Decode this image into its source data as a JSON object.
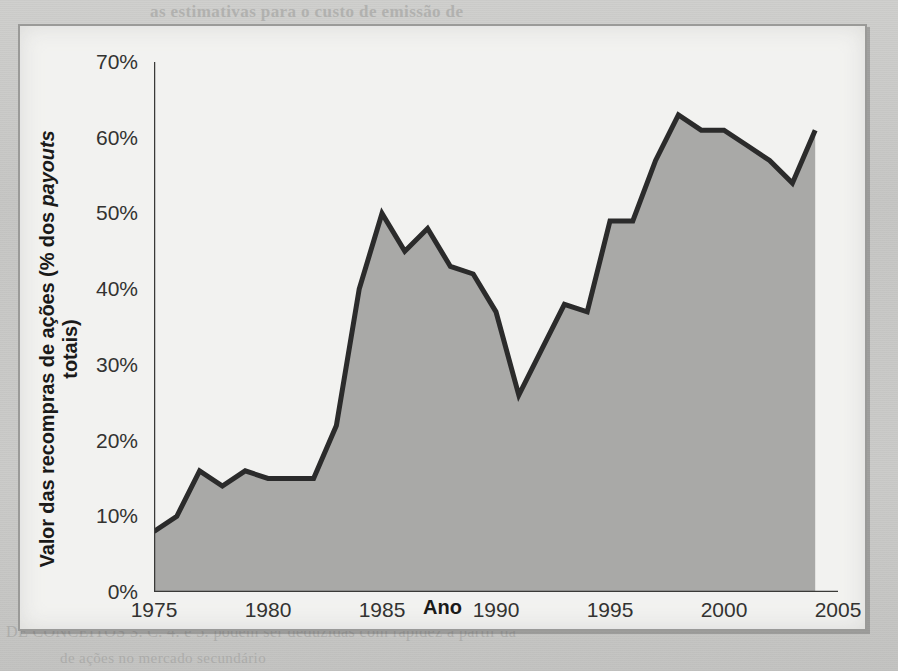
{
  "page": {
    "background_color": "#c9c9c7",
    "panel_color": "#f2f2f0",
    "ghost_text_top": "as estimativas para o custo de emissão de",
    "ghost_text_top2": "em 2004, sugerindo que as empresas estao adotando um",
    "ghost_text_bottom": "DE CONCEITOS    3. C. 4. e  5. podem ser deduzidas com rapidez a partir da",
    "ghost_text_bottom2": "de ações no mercado secundário"
  },
  "figure": {
    "border_color": "#9a9a98"
  },
  "chart_data": {
    "type": "area",
    "title": "",
    "subtitle": "",
    "xlabel": "Ano",
    "ylabel": "Valor das recompras de ações (% dos payouts totais)",
    "ylabel_parts": {
      "pre": "Valor das recompras de ações (% dos ",
      "italic": "payouts",
      "post": " totais)"
    },
    "xlim": [
      1975,
      2005
    ],
    "ylim": [
      0,
      70
    ],
    "grid": false,
    "legend": null,
    "y_tick_labels": [
      "0%",
      "10%",
      "20%",
      "30%",
      "40%",
      "50%",
      "60%",
      "70%"
    ],
    "y_tick_values": [
      0,
      10,
      20,
      30,
      40,
      50,
      60,
      70
    ],
    "x_tick_labels": [
      "1975",
      "1980",
      "1985",
      "1990",
      "1995",
      "2000",
      "2005"
    ],
    "x_tick_values": [
      1975,
      1980,
      1985,
      1990,
      1995,
      2000,
      2005
    ],
    "line_color": "#2b2b2b",
    "fill_color": "#a9a9a7",
    "line_width": 5,
    "x": [
      1975,
      1976,
      1977,
      1978,
      1979,
      1980,
      1981,
      1982,
      1983,
      1984,
      1985,
      1986,
      1987,
      1988,
      1989,
      1990,
      1991,
      1992,
      1993,
      1994,
      1995,
      1996,
      1997,
      1998,
      1999,
      2000,
      2001,
      2002,
      2003,
      2004
    ],
    "values": [
      8,
      10,
      16,
      14,
      16,
      15,
      15,
      15,
      22,
      40,
      50,
      45,
      48,
      43,
      42,
      37,
      26,
      32,
      38,
      37,
      49,
      49,
      57,
      63,
      61,
      61,
      59,
      57,
      54,
      61
    ],
    "series": [
      {
        "name": "Valor das recompras de ações",
        "values": [
          8,
          10,
          16,
          14,
          16,
          15,
          15,
          15,
          22,
          40,
          50,
          45,
          48,
          43,
          42,
          37,
          26,
          32,
          38,
          37,
          49,
          49,
          57,
          63,
          61,
          61,
          59,
          57,
          54,
          61
        ]
      }
    ]
  }
}
